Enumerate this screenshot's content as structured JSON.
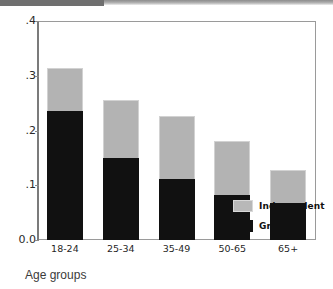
{
  "figure": {
    "x_axis_title": "Age groups",
    "legend": {
      "items": [
        {
          "label": "Independent",
          "color": "#b3b3b3",
          "swatch": "independent"
        },
        {
          "label": "Green",
          "color": "#111111",
          "swatch": "green"
        }
      ]
    }
  },
  "chart_data": {
    "type": "bar",
    "stacked": true,
    "title": "",
    "subtitle": "",
    "xlabel": "Age groups",
    "ylabel": "",
    "categories": [
      "18-24",
      "25-34",
      "35-49",
      "50-65",
      "65+"
    ],
    "series": [
      {
        "name": "Green",
        "color": "#111111",
        "values": [
          0.235,
          0.149,
          0.112,
          0.083,
          0.068
        ]
      },
      {
        "name": "Independent",
        "color": "#b3b3b3",
        "values": [
          0.079,
          0.106,
          0.115,
          0.097,
          0.059
        ]
      }
    ],
    "totals": [
      0.314,
      0.255,
      0.227,
      0.18,
      0.127
    ],
    "ylim": [
      0.0,
      0.4
    ],
    "yticks": [
      "0.0",
      ".1",
      ".2",
      ".3",
      ".4"
    ],
    "ytick_values": [
      0.0,
      0.1,
      0.2,
      0.3,
      0.4
    ],
    "grid": false,
    "legend_position": "inside-bottom-right"
  }
}
